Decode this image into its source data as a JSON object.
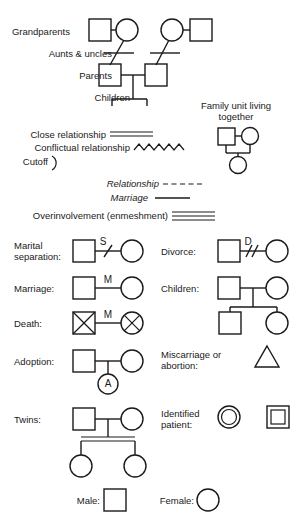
{
  "family_tree": {
    "labels": {
      "grandparents": "Grandparents",
      "aunts_uncles": "Aunts & uncles",
      "parents": "Parents",
      "children": "Children"
    }
  },
  "family_unit": {
    "caption_line1": "Family unit living",
    "caption_line2": "together"
  },
  "relationship_lines": [
    {
      "label": "Close relationship",
      "style": "double-line"
    },
    {
      "label": "Conflictual relationship",
      "style": "zigzag"
    },
    {
      "label": "Cutoff",
      "style": "arc"
    }
  ],
  "line_key": [
    {
      "label": "Relationship",
      "style": "dashed",
      "italic": true
    },
    {
      "label": "Marriage",
      "style": "solid",
      "italic": true
    }
  ],
  "overinvolvement": {
    "label": "Overinvolvement (enmeshment)",
    "style": "triple-line"
  },
  "symbols_left": [
    {
      "label": "Marital\nseparation:",
      "label_line1": "Marital",
      "label_line2": "separation:",
      "marker": "S",
      "mark_style": "single-slash"
    },
    {
      "label": "Marriage:",
      "marker": "M",
      "mark_style": "none"
    },
    {
      "label": "Death:",
      "marker": "M",
      "mark_style": "crossed-out"
    },
    {
      "label": "Adoption:",
      "marker": "A",
      "mark_style": "child-adopted"
    },
    {
      "label": "Twins:",
      "marker": "",
      "mark_style": "twin-sibling-line"
    }
  ],
  "symbols_right": [
    {
      "label": "Divorce:",
      "marker": "D",
      "mark_style": "double-slash"
    },
    {
      "label": "Children:",
      "marker": "",
      "mark_style": "two-children"
    },
    {
      "label_line1": "Miscarriage or",
      "label_line2": "abortion:",
      "marker": "",
      "mark_style": "triangle"
    },
    {
      "label_line1": "Identified",
      "label_line2": "patient:",
      "marker": "",
      "mark_style": "double-circle-double-square"
    }
  ],
  "gender_key": {
    "male_label": "Male:",
    "female_label": "Female:"
  },
  "colors": {
    "ink": "#1a1a1a",
    "background": "#ffffff"
  }
}
